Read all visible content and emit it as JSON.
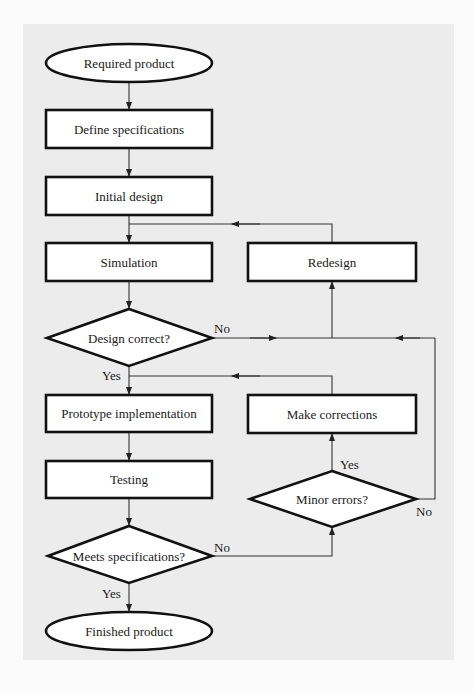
{
  "diagram": {
    "type": "flowchart",
    "background_color": "#ececec",
    "nodes": {
      "start": {
        "label": "Required product",
        "shape": "ellipse"
      },
      "define": {
        "label": "Define specifications",
        "shape": "rect"
      },
      "initial": {
        "label": "Initial design",
        "shape": "rect"
      },
      "simulation": {
        "label": "Simulation",
        "shape": "rect"
      },
      "redesign": {
        "label": "Redesign",
        "shape": "rect"
      },
      "design_correct": {
        "label": "Design correct?",
        "shape": "diamond"
      },
      "prototype": {
        "label": "Prototype implementation",
        "shape": "rect"
      },
      "make_corrections": {
        "label": "Make corrections",
        "shape": "rect"
      },
      "testing": {
        "label": "Testing",
        "shape": "rect"
      },
      "minor_errors": {
        "label": "Minor errors?",
        "shape": "diamond"
      },
      "meets_specs": {
        "label": "Meets specifications?",
        "shape": "diamond"
      },
      "end": {
        "label": "Finished product",
        "shape": "ellipse"
      }
    },
    "edge_labels": {
      "design_correct_no": "No",
      "design_correct_yes": "Yes",
      "minor_errors_yes": "Yes",
      "minor_errors_no": "No",
      "meets_specs_no": "No",
      "meets_specs_yes": "Yes"
    },
    "edges": [
      {
        "from": "start",
        "to": "define"
      },
      {
        "from": "define",
        "to": "initial"
      },
      {
        "from": "initial",
        "to": "simulation"
      },
      {
        "from": "simulation",
        "to": "design_correct"
      },
      {
        "from": "design_correct",
        "to": "redesign",
        "label": "No"
      },
      {
        "from": "redesign",
        "to": "simulation"
      },
      {
        "from": "design_correct",
        "to": "prototype",
        "label": "Yes"
      },
      {
        "from": "prototype",
        "to": "testing"
      },
      {
        "from": "testing",
        "to": "meets_specs"
      },
      {
        "from": "meets_specs",
        "to": "minor_errors",
        "label": "No"
      },
      {
        "from": "minor_errors",
        "to": "make_corrections",
        "label": "Yes"
      },
      {
        "from": "make_corrections",
        "to": "prototype"
      },
      {
        "from": "minor_errors",
        "to": "redesign",
        "label": "No"
      },
      {
        "from": "meets_specs",
        "to": "end",
        "label": "Yes"
      }
    ]
  }
}
